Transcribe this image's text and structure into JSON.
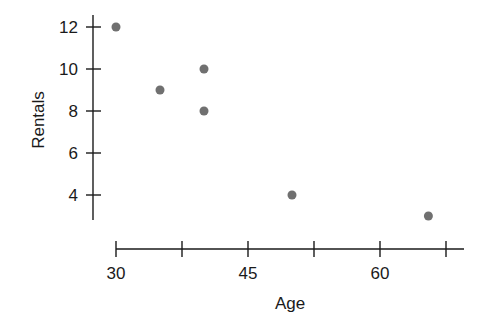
{
  "chart_data": {
    "type": "scatter",
    "title": "",
    "xlabel": "Age",
    "ylabel": "Rentals",
    "x": [
      30,
      35,
      40,
      40,
      50,
      65.5
    ],
    "y": [
      12,
      9,
      10,
      8,
      4,
      3
    ],
    "xlim": [
      30,
      68
    ],
    "ylim": [
      2.8,
      12.5
    ],
    "xticks": [
      30,
      37.5,
      45,
      52.5,
      60,
      67.5
    ],
    "xtick_labels": [
      "30",
      "",
      "45",
      "",
      "60",
      ""
    ],
    "yticks": [
      4,
      6,
      8,
      10,
      12
    ],
    "ytick_labels": [
      "4",
      "6",
      "8",
      "10",
      "12"
    ],
    "grid": false,
    "legend": null,
    "marker_color": "#707070",
    "axis_color": "#1a1a1a"
  }
}
